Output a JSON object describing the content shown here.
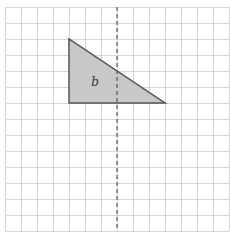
{
  "diagram": {
    "type": "grid-reflection",
    "grid": {
      "origin_px": [
        5,
        7
      ],
      "cell_size_px": 16,
      "columns": 14,
      "rows": 14,
      "line_color": "#d6d6d6"
    },
    "mirror_line": {
      "orientation": "vertical",
      "x_px": 117,
      "style": "dashed",
      "color": "#555555"
    },
    "shape": {
      "name": "b",
      "label": "b",
      "kind": "right-triangle",
      "vertices_grid": [
        [
          4,
          2
        ],
        [
          4,
          6
        ],
        [
          10,
          6
        ]
      ],
      "fill": "#c8c8c8",
      "stroke": "#555555"
    }
  }
}
